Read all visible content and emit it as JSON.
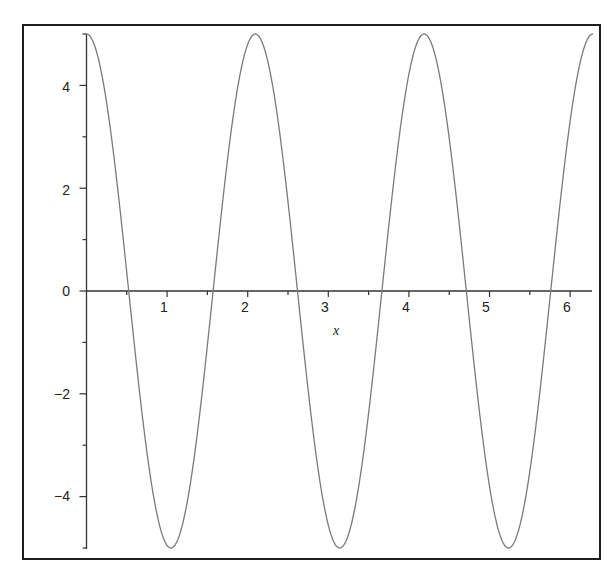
{
  "chart_data": {
    "type": "line",
    "title": "",
    "xlabel": "x",
    "ylabel": "",
    "function": "5*cos(3*x)",
    "xlim": [
      0,
      6.283
    ],
    "ylim": [
      -5,
      5
    ],
    "grid": false,
    "legend": null,
    "x_ticks": [
      1,
      2,
      3,
      4,
      5,
      6
    ],
    "x_tick_labels": [
      "1",
      "2",
      "3",
      "4",
      "5",
      "6"
    ],
    "x_minor_ticks": [
      0.5,
      1.5,
      2.5,
      3.5,
      4.5,
      5.5
    ],
    "y_ticks": [
      -4,
      -2,
      0,
      2,
      4
    ],
    "y_tick_labels": [
      "-4",
      "-2",
      "0",
      "2",
      "4"
    ],
    "y_minor_ticks": [
      -5,
      -3,
      -1,
      1,
      3,
      5
    ],
    "series": [
      {
        "name": "5cos(3x)",
        "color": "#7a7a7a",
        "key_points": [
          {
            "x": 0.0,
            "y": 5
          },
          {
            "x": 0.524,
            "y": 0
          },
          {
            "x": 1.047,
            "y": -5
          },
          {
            "x": 1.571,
            "y": 0
          },
          {
            "x": 2.094,
            "y": 5
          },
          {
            "x": 2.618,
            "y": 0
          },
          {
            "x": 3.142,
            "y": -5
          },
          {
            "x": 3.665,
            "y": 0
          },
          {
            "x": 4.189,
            "y": 5
          },
          {
            "x": 4.712,
            "y": 0
          },
          {
            "x": 5.236,
            "y": -5
          },
          {
            "x": 5.76,
            "y": 0
          },
          {
            "x": 6.283,
            "y": 5
          }
        ]
      }
    ]
  },
  "labels": {
    "x_axis": "x",
    "x_ticks": [
      "1",
      "2",
      "3",
      "4",
      "5",
      "6"
    ],
    "y_ticks": [
      "4",
      "2",
      "0",
      "−2",
      "−4"
    ]
  },
  "colors": {
    "curve": "#7a7a7a",
    "axis": "#333333",
    "frame": "#1e1e1e"
  }
}
